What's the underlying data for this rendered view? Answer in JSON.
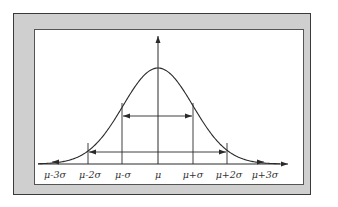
{
  "diagram": {
    "x_labels": [
      "μ-3σ",
      "μ-2σ",
      "μ-σ",
      "μ",
      "μ+σ",
      "μ+2σ",
      "μ+3σ"
    ],
    "ranges": [
      {
        "name": "one-sigma",
        "from": "μ-σ",
        "to": "μ+σ"
      },
      {
        "name": "two-sigma",
        "from": "μ-2σ",
        "to": "μ+2σ"
      }
    ],
    "colors": {
      "frame_fill": "#cfcfcf",
      "frame_border": "#3a3a3a",
      "panel": "#ffffff",
      "ink": "#2a2a2a"
    }
  }
}
